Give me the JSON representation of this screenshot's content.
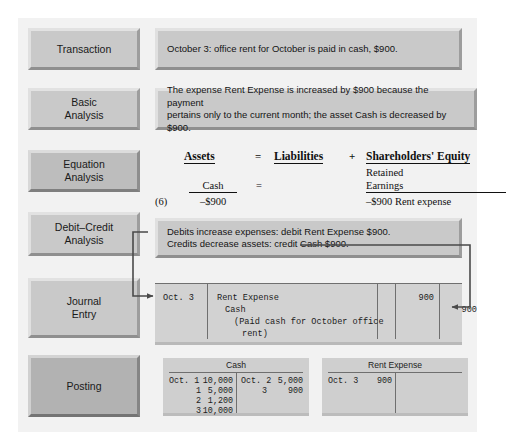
{
  "stages": [
    {
      "id": "transaction",
      "label": "Transaction"
    },
    {
      "id": "basic-analysis",
      "label": "Basic\nAnalysis"
    },
    {
      "id": "equation-analysis",
      "label": "Equation\nAnalysis"
    },
    {
      "id": "debit-credit-analysis",
      "label": "Debit–Credit\nAnalysis"
    },
    {
      "id": "journal-entry",
      "label": "Journal\nEntry"
    },
    {
      "id": "posting",
      "label": "Posting"
    }
  ],
  "transaction": {
    "text": "October 3: office rent for October is paid in cash, $900."
  },
  "basic_analysis": {
    "line1": "The expense Rent Expense is increased by $900 because the payment",
    "line2": "pertains only to the current month; the asset Cash is decreased by $900."
  },
  "equation_analysis": {
    "headers": {
      "assets": "Assets",
      "equals": "=",
      "liabilities": "Liabilities",
      "plus": "+",
      "equity": "Shareholders' Equity"
    },
    "equity_sub_line1": "Retained",
    "equity_sub_line2": "Earnings",
    "asset_account": "Cash",
    "equals_row": "=",
    "entry_number": "(6)",
    "asset_amount": "–$900",
    "equity_amount": "–$900 Rent expense"
  },
  "debit_credit_analysis": {
    "line1": "Debits increase expenses: debit Rent Expense $900.",
    "line2": "Credits decrease assets: credit Cash $900."
  },
  "journal_entry": {
    "date": "Oct. 3",
    "account_debit": "Rent Expense",
    "account_credit": "Cash",
    "explanation_line1": "(Paid cash for October office",
    "explanation_line2": "rent)",
    "debit_amount": "900",
    "credit_amount": "900"
  },
  "posting": {
    "cash_account": {
      "title": "Cash",
      "debits": [
        {
          "date": "Oct. 1",
          "amount": "10,000"
        },
        {
          "date": "1",
          "amount": "5,000"
        },
        {
          "date": "2",
          "amount": "1,200"
        },
        {
          "date": "3",
          "amount": "10,000"
        }
      ],
      "credits": [
        {
          "date": "Oct. 2",
          "amount": "5,000"
        },
        {
          "date": "3",
          "amount": "900"
        }
      ]
    },
    "rent_expense_account": {
      "title": "Rent Expense",
      "debits": [
        {
          "date": "Oct. 3",
          "amount": "900"
        }
      ],
      "credits": []
    }
  },
  "colors": {
    "panel_background": "#f2f2f2",
    "box_fill": "#c9c9c9",
    "table_fill": "#d2d2d2",
    "arrow": "#4a4a4a",
    "text": "#141414"
  }
}
